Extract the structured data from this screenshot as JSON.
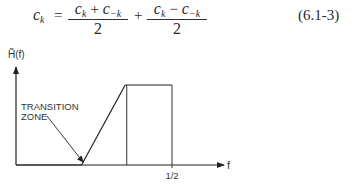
{
  "equation": {
    "lhs_var": "c",
    "lhs_sub": "k",
    "equals": "=",
    "frac1": {
      "num_a_var": "c",
      "num_a_sub": "k",
      "num_op": "+",
      "num_b_var": "c",
      "num_b_sub": "−k",
      "den": "2"
    },
    "plus": "+",
    "frac2": {
      "num_a_var": "c",
      "num_a_sub": "k",
      "num_op": "−",
      "num_b_var": "c",
      "num_b_sub": "−k",
      "den": "2"
    },
    "number": "(6.1-3)"
  },
  "chart_data": {
    "type": "line",
    "title": "",
    "ylabel": "H̃(f)",
    "xlabel": "f",
    "x_tick_labels": [
      "1/2"
    ],
    "x_ticks": [
      0.5
    ],
    "xlim": [
      0,
      0.62
    ],
    "ylim": [
      0,
      1.1
    ],
    "grid": false,
    "series": [
      {
        "name": "H̃(f)",
        "points": [
          [
            0,
            0
          ],
          [
            0.21,
            0
          ],
          [
            0.35,
            1
          ],
          [
            0.5,
            1
          ]
        ]
      }
    ],
    "reference_lines": [
      {
        "name": "passband-start",
        "x": 0.355,
        "from": 0,
        "to": 1
      },
      {
        "name": "half-frequency",
        "x": 0.5,
        "from": 0,
        "to": 1
      }
    ],
    "annotations": [
      {
        "text_lines": [
          "TRANSITION",
          "ZONE"
        ],
        "points_to": "transition ramp"
      }
    ]
  }
}
